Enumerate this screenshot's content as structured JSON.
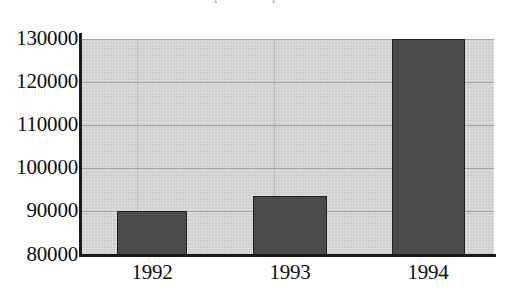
{
  "figure": {
    "title_remnant": "Corporate Expenditures",
    "background_color": "#ffffff",
    "plot_background_color": "#d6d6d6",
    "bar_color": "#4b4b4b",
    "bar_border_color": "#222222",
    "axis_color": "#1a1a1a",
    "gridline_color": "#9c9c9c",
    "text_color": "#0d0d0d"
  },
  "chart_data": {
    "type": "bar",
    "title": "",
    "xlabel": "",
    "ylabel": "",
    "categories": [
      "1992",
      "1993",
      "1994"
    ],
    "values": [
      90000,
      93000,
      130000
    ],
    "ylim": [
      80000,
      130000
    ],
    "yticks": [
      80000,
      90000,
      100000,
      110000,
      120000,
      130000
    ],
    "ytick_labels": [
      "80000",
      "90000",
      "100000",
      "110000",
      "120000",
      "130000"
    ],
    "xtick_labels": [
      "1992",
      "1993",
      "1994"
    ],
    "grid": true,
    "legend": null,
    "legend_position": "none",
    "annotations": []
  },
  "geometry": {
    "plot": {
      "left": 82,
      "top": 39,
      "width": 412,
      "height": 216
    },
    "y_pixels": [
      255,
      211,
      168,
      125,
      82,
      39
    ],
    "v_gridlines_x": [
      137,
      274,
      411
    ],
    "bars": [
      {
        "label": "1992",
        "x": 35,
        "width": 70,
        "top": 172,
        "height": 44
      },
      {
        "label": "1993",
        "x": 171,
        "width": 74,
        "top": 157,
        "height": 59
      },
      {
        "label": "1994",
        "x": 310,
        "width": 73,
        "top": 0,
        "height": 216
      }
    ],
    "x_label_centers": [
      152,
      290,
      428
    ]
  }
}
